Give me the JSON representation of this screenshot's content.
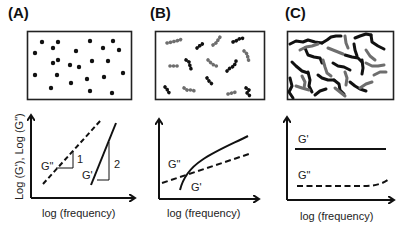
{
  "figure": {
    "panels": [
      {
        "id": "A",
        "label": "(A)",
        "schematic": "isolated dispersed particles (dots)",
        "plot": {
          "xlabel": "log (frequency)",
          "ylabel": "Log (G'), Log (G\")",
          "curves": [
            {
              "name": "G\"",
              "style": "dashed",
              "slope_label": "1"
            },
            {
              "name": "G'",
              "style": "solid",
              "slope_label": "2"
            }
          ]
        }
      },
      {
        "id": "B",
        "label": "(B)",
        "schematic": "short separated chains (grey and black)",
        "plot": {
          "xlabel": "log (frequency)",
          "curves": [
            {
              "name": "G\"",
              "style": "dashed"
            },
            {
              "name": "G'",
              "style": "solid"
            }
          ]
        }
      },
      {
        "id": "C",
        "label": "(C)",
        "schematic": "entangled network of chains (grey and black)",
        "plot": {
          "xlabel": "log (frequency)",
          "curves": [
            {
              "name": "G'",
              "style": "solid"
            },
            {
              "name": "G\"",
              "style": "dashed"
            }
          ]
        }
      }
    ],
    "colors": {
      "ink": "#111111",
      "grey_chain": "#6e6e6e",
      "black_chain": "#111111"
    }
  }
}
